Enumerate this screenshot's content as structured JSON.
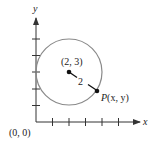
{
  "diagram": {
    "axes": {
      "x_label": "x",
      "y_label": "y",
      "origin_label": "(0, 0)",
      "x_ticks": [
        1,
        2,
        3,
        4,
        5
      ],
      "y_ticks": [
        1,
        2,
        3,
        4,
        5
      ]
    },
    "circle": {
      "center": [
        2,
        3
      ],
      "center_label": "(2, 3)",
      "radius": 2,
      "radius_label": "2"
    },
    "point": {
      "label_P": "P",
      "label_coords": "(x, y)"
    },
    "colors": {
      "circle": "#8a8a8a",
      "axes": "#333333",
      "point": "#111111"
    }
  }
}
